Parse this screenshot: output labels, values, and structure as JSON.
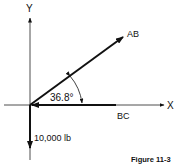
{
  "diagram": {
    "axes": {
      "x_label": "X",
      "y_label": "Y"
    },
    "vectors": [
      {
        "name": "AB",
        "label": "AB",
        "direction": "up-right"
      },
      {
        "name": "BC",
        "label": "BC",
        "direction": "left"
      },
      {
        "name": "load",
        "label": "10,000 lb",
        "direction": "down"
      }
    ],
    "angle": {
      "label": "36.8°",
      "between": [
        "AB",
        "BC"
      ]
    },
    "caption": "Figure 11-3",
    "colors": {
      "ink": "#111111",
      "background": "#ffffff"
    }
  }
}
